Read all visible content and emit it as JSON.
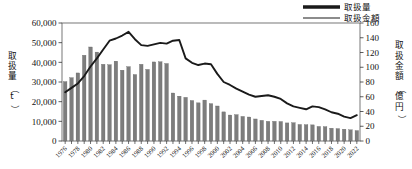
{
  "chart_data": {
    "type": "bar",
    "title": "",
    "xlabel": "",
    "ylabel": "取扱量（t）",
    "y2label": "取扱金額（億円）",
    "ylim": [
      0,
      60000
    ],
    "y2lim": [
      0,
      160
    ],
    "grid": false,
    "legend_position": "top-right",
    "y_ticks": [
      "0",
      "10,000",
      "20,000",
      "30,000",
      "40,000",
      "50,000",
      "60,000"
    ],
    "y_tick_values": [
      0,
      10000,
      20000,
      30000,
      40000,
      50000,
      60000
    ],
    "y2_ticks": [
      "0",
      "20",
      "40",
      "60",
      "80",
      "100",
      "120",
      "140",
      "160"
    ],
    "y2_tick_values": [
      0,
      20,
      40,
      60,
      80,
      100,
      120,
      140,
      160
    ],
    "x_tick_labels": [
      "1976",
      "1978",
      "1980",
      "1982",
      "1984",
      "1986",
      "1988",
      "1990",
      "1992",
      "1994",
      "1996",
      "1998",
      "2000",
      "2002",
      "2004",
      "2006",
      "2008",
      "2010",
      "2012",
      "2014",
      "2016",
      "2018",
      "2020",
      "2022"
    ],
    "categories": [
      "1976",
      "1977",
      "1978",
      "1979",
      "1980",
      "1981",
      "1982",
      "1983",
      "1984",
      "1985",
      "1986",
      "1987",
      "1988",
      "1989",
      "1990",
      "1991",
      "1992",
      "1993",
      "1994",
      "1995",
      "1996",
      "1997",
      "1998",
      "1999",
      "2000",
      "2001",
      "2002",
      "2003",
      "2004",
      "2005",
      "2006",
      "2007",
      "2008",
      "2009",
      "2010",
      "2011",
      "2012",
      "2013",
      "2014",
      "2015",
      "2016",
      "2017",
      "2018",
      "2019",
      "2020",
      "2021",
      "2022"
    ],
    "series": [
      {
        "name": "取扱量",
        "axis": "left",
        "unit": "t",
        "render": "bar",
        "color": "#7d7d7d",
        "values": [
          30200,
          32200,
          34600,
          43600,
          47800,
          45200,
          39000,
          38800,
          40600,
          36000,
          37800,
          33800,
          39000,
          36400,
          40200,
          40300,
          39400,
          24400,
          22800,
          22200,
          20600,
          19400,
          20800,
          19000,
          17800,
          14800,
          13200,
          13400,
          12500,
          12200,
          11200,
          10500,
          10000,
          10000,
          9900,
          9200,
          9300,
          8400,
          8300,
          8200,
          7400,
          7300,
          6500,
          6300,
          6000,
          5700,
          5300
        ]
      },
      {
        "name": "取扱金額",
        "axis": "right",
        "unit": "億円",
        "render": "line",
        "color": "#1a1a1a",
        "values": [
          66,
          72,
          78,
          88,
          101,
          112,
          124,
          136,
          139,
          143,
          148,
          138,
          130,
          129,
          131,
          133,
          132,
          136,
          137,
          112,
          106,
          103,
          105,
          104,
          91,
          80,
          76,
          71,
          67,
          63,
          60,
          61,
          62,
          60,
          57,
          51,
          47,
          45,
          43,
          47,
          46,
          43,
          39,
          37,
          33,
          31,
          35
        ]
      }
    ],
    "legend": [
      {
        "label": "取扱量",
        "style": "thick-line",
        "color": "#1a1a1a"
      },
      {
        "label": "取扱金額",
        "style": "thin-line",
        "color": "#1a1a1a"
      }
    ]
  },
  "axes": {
    "left_title_chars": [
      "取",
      "扱",
      "量",
      "（",
      "t",
      "）"
    ],
    "right_title_chars": [
      "取",
      "扱",
      "金",
      "額",
      "（",
      "億",
      "円",
      "）"
    ]
  }
}
